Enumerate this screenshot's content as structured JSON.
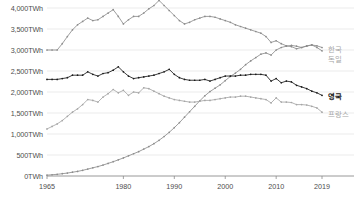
{
  "chart_data": {
    "type": "line",
    "title": "",
    "xlabel": "",
    "ylabel": "",
    "xlim": [
      1965,
      2019
    ],
    "ylim": [
      0,
      4000
    ],
    "y_unit": "TWh",
    "grid": true,
    "legend_position": "right-end-of-line",
    "y_ticks": [
      0,
      500,
      1000,
      1500,
      2000,
      2500,
      3000,
      3500,
      4000
    ],
    "y_tick_labels": [
      "0TWh",
      "500TWh",
      "1,000TWh",
      "1,500TWh",
      "2,000TWh",
      "2,500TWh",
      "3,000TWh",
      "3,500TWh",
      "4,000TWh"
    ],
    "x_ticks": [
      1965,
      1980,
      1990,
      2000,
      2010,
      2019
    ],
    "x_tick_labels": [
      "1965",
      "1980",
      "1990",
      "2000",
      "2010",
      "2019"
    ],
    "x": [
      1965,
      1966,
      1967,
      1968,
      1969,
      1970,
      1971,
      1972,
      1973,
      1974,
      1975,
      1976,
      1977,
      1978,
      1979,
      1980,
      1981,
      1982,
      1983,
      1984,
      1985,
      1986,
      1987,
      1988,
      1989,
      1990,
      1991,
      1992,
      1993,
      1994,
      1995,
      1996,
      1997,
      1998,
      1999,
      2000,
      2001,
      2002,
      2003,
      2004,
      2005,
      2006,
      2007,
      2008,
      2009,
      2010,
      2011,
      2012,
      2013,
      2014,
      2015,
      2016,
      2017,
      2018,
      2019
    ],
    "series": [
      {
        "name": "한국",
        "color": "#8c8c8c",
        "marker": "dot",
        "values": [
          3000,
          3000,
          3000,
          3150,
          3320,
          3480,
          3600,
          3680,
          3760,
          3700,
          3720,
          3800,
          3880,
          3960,
          3800,
          3620,
          3720,
          3800,
          3800,
          3880,
          3980,
          4060,
          4180,
          4060,
          3940,
          3820,
          3700,
          3620,
          3660,
          3720,
          3760,
          3800,
          3800,
          3780,
          3740,
          3700,
          3660,
          3600,
          3560,
          3520,
          3480,
          3440,
          3400,
          3320,
          3180,
          3220,
          3150,
          3100,
          3080,
          3030,
          3060,
          3100,
          3120,
          3060,
          2980
        ]
      },
      {
        "name": "독일",
        "color": "#8c8c8c",
        "marker": "dot",
        "values": [
          20,
          30,
          40,
          55,
          70,
          90,
          110,
          135,
          165,
          195,
          225,
          260,
          300,
          340,
          385,
          430,
          480,
          530,
          580,
          640,
          700,
          770,
          850,
          940,
          1040,
          1150,
          1270,
          1400,
          1530,
          1660,
          1790,
          1910,
          2010,
          2090,
          2170,
          2270,
          2370,
          2450,
          2540,
          2650,
          2740,
          2820,
          2900,
          2930,
          2880,
          3000,
          3060,
          3090,
          3110,
          3090,
          3060,
          3090,
          3120,
          3100,
          3060
        ]
      },
      {
        "name": "영국",
        "color": "#1a1a1a",
        "marker": "dot",
        "values": [
          2300,
          2300,
          2300,
          2320,
          2340,
          2400,
          2400,
          2400,
          2480,
          2420,
          2380,
          2440,
          2460,
          2520,
          2600,
          2480,
          2380,
          2320,
          2340,
          2360,
          2380,
          2400,
          2440,
          2480,
          2540,
          2420,
          2340,
          2300,
          2280,
          2280,
          2280,
          2300,
          2260,
          2300,
          2340,
          2380,
          2380,
          2380,
          2400,
          2400,
          2420,
          2420,
          2420,
          2400,
          2260,
          2320,
          2220,
          2260,
          2240,
          2160,
          2120,
          2080,
          2020,
          1980,
          1920
        ]
      },
      {
        "name": "프랑스",
        "color": "#a6a6a6",
        "marker": "dot",
        "values": [
          1120,
          1180,
          1240,
          1320,
          1420,
          1520,
          1600,
          1700,
          1820,
          1800,
          1760,
          1880,
          1960,
          2060,
          1980,
          2040,
          1920,
          2000,
          1980,
          2100,
          2080,
          2020,
          1960,
          1900,
          1860,
          1820,
          1800,
          1780,
          1760,
          1760,
          1780,
          1800,
          1800,
          1820,
          1840,
          1860,
          1880,
          1880,
          1900,
          1900,
          1880,
          1860,
          1840,
          1820,
          1740,
          1860,
          1760,
          1760,
          1750,
          1700,
          1700,
          1690,
          1660,
          1620,
          1520
        ]
      }
    ],
    "series_labels": [
      {
        "name": "한국",
        "y_value": 3040,
        "style": "grey"
      },
      {
        "name": "독일",
        "y_value": 2820,
        "style": "grey"
      },
      {
        "name": "영국",
        "y_value": 1920,
        "style": "dark"
      },
      {
        "name": "프랑스",
        "y_value": 1500,
        "style": "grey"
      }
    ]
  }
}
